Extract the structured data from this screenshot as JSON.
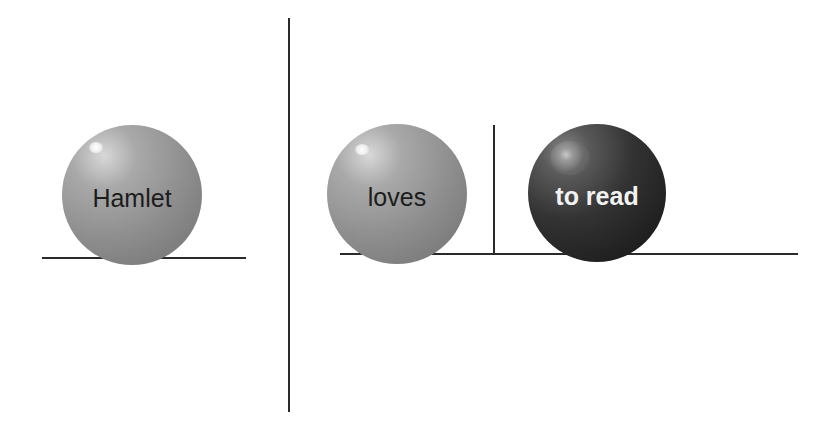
{
  "diagram": {
    "left_group": {
      "ball_label": "Hamlet"
    },
    "right_group": {
      "balls": [
        {
          "label": "loves"
        },
        {
          "label": "to read"
        }
      ]
    },
    "colors": {
      "line": "#2a2a2a",
      "light_ball": "#8f8f8f",
      "dark_ball": "#262626",
      "light_text": "#1c1c1c",
      "dark_text": "#f2f2f2",
      "background": "#ffffff"
    }
  }
}
